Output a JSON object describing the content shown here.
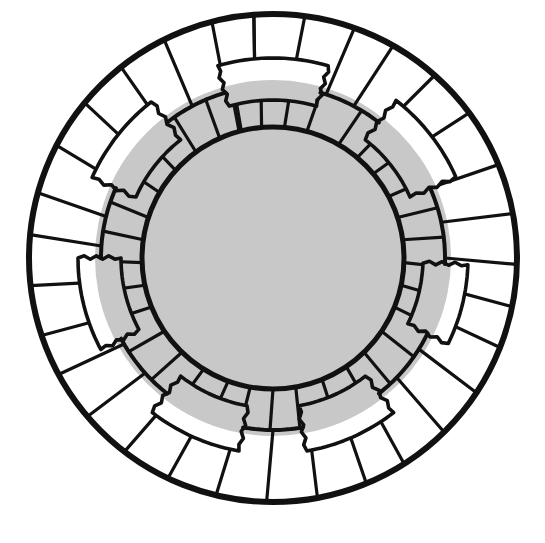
{
  "canvas": {
    "width": 545,
    "height": 543,
    "background": "#ffffff"
  },
  "colors": {
    "stroke": "#111111",
    "grey_fill": "#c8c8c8",
    "white_fill": "#ffffff"
  },
  "chart_data": {
    "type": "diagram",
    "title": "",
    "center": [
      273,
      258
    ],
    "radii": {
      "outer": 244,
      "middle": 172,
      "inner": 131,
      "grey_extent": 178
    },
    "stroke_widths": {
      "outer": 6,
      "middle": 4,
      "inner": 5,
      "spoke": 3.2,
      "patch": 3.6
    },
    "outer_ring_spokes_deg": [
      -96,
      -84,
      -72,
      -62,
      -50,
      -38,
      -24,
      -12,
      0,
      10,
      20,
      32,
      44,
      56,
      66,
      78,
      90,
      102,
      114,
      126,
      138,
      150,
      160,
      172,
      184,
      194,
      206,
      218,
      230,
      242,
      254,
      264
    ],
    "inner_ring_spokes_deg": [
      -105,
      -95,
      -85,
      -75,
      -60,
      -50,
      -40,
      -28,
      -18,
      -8,
      2,
      12,
      22,
      34,
      46,
      56,
      68,
      80,
      90,
      100,
      110,
      122,
      134,
      146,
      158,
      168,
      178,
      188,
      198,
      210,
      222,
      234,
      246,
      256
    ],
    "patches": [
      {
        "id": "patch-top",
        "start_deg": -106,
        "end_deg": -74,
        "r_in": 158,
        "r_out": 200
      },
      {
        "id": "patch-upper-right",
        "start_deg": -52,
        "end_deg": -24,
        "r_in": 150,
        "r_out": 200
      },
      {
        "id": "patch-right",
        "start_deg": 2,
        "end_deg": 26,
        "r_in": 150,
        "r_out": 195
      },
      {
        "id": "patch-lower-right",
        "start_deg": 52,
        "end_deg": 80,
        "r_in": 150,
        "r_out": 196
      },
      {
        "id": "patch-lower-left",
        "start_deg": 100,
        "end_deg": 128,
        "r_in": 150,
        "r_out": 196
      },
      {
        "id": "patch-left",
        "start_deg": 152,
        "end_deg": 180,
        "r_in": 152,
        "r_out": 195
      },
      {
        "id": "patch-upper-left",
        "start_deg": 204,
        "end_deg": 232,
        "r_in": 150,
        "r_out": 198
      }
    ]
  }
}
